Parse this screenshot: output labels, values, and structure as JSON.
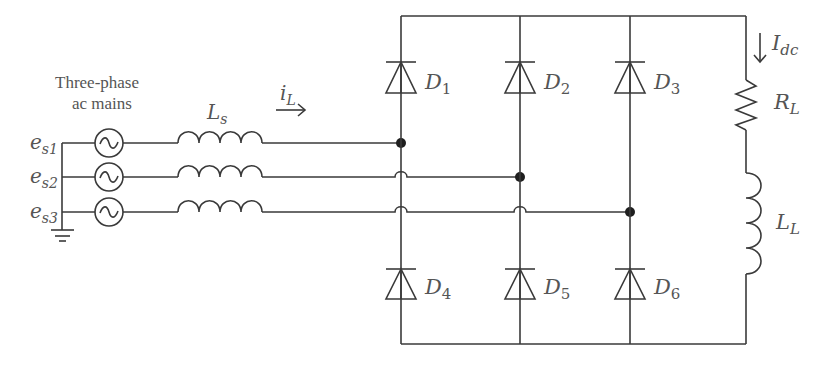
{
  "diagram": {
    "type": "circuit",
    "source": {
      "caption_line1": "Three-phase",
      "caption_line2": "ac mains",
      "phases": [
        {
          "main": "e",
          "sub": "s1"
        },
        {
          "main": "e",
          "sub": "s2"
        },
        {
          "main": "e",
          "sub": "s3"
        }
      ]
    },
    "line_inductor": {
      "main": "L",
      "sub": "s"
    },
    "line_current": {
      "main": "i",
      "sub": "L"
    },
    "diodes": [
      {
        "main": "D",
        "sub": "1"
      },
      {
        "main": "D",
        "sub": "2"
      },
      {
        "main": "D",
        "sub": "3"
      },
      {
        "main": "D",
        "sub": "4"
      },
      {
        "main": "D",
        "sub": "5"
      },
      {
        "main": "D",
        "sub": "6"
      }
    ],
    "load": {
      "current": {
        "main": "I",
        "sub": "dc"
      },
      "resistor": {
        "main": "R",
        "sub": "L"
      },
      "inductor": {
        "main": "L",
        "sub": "L"
      }
    },
    "colors": {
      "line": "#3a3a3a",
      "text": "#555555",
      "background": "#ffffff"
    }
  }
}
